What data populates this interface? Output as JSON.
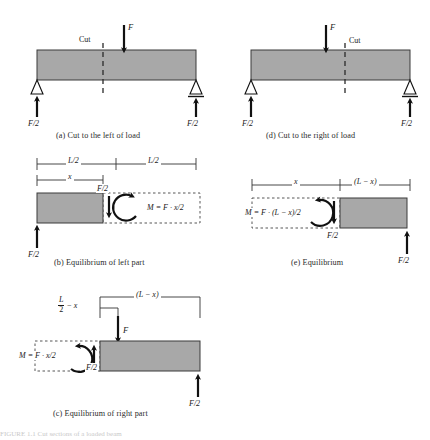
{
  "figure": {
    "colors": {
      "beam_fill": "#a8a8a8",
      "beam_stroke": "#3a3a3a",
      "line": "#1a1a1a",
      "dashed": "#2a2a2a",
      "caption": "#2b2b2b",
      "background": "#ffffff"
    },
    "panels": [
      {
        "id": "a",
        "caption": "(a) Cut to the left of load",
        "labels": {
          "cut": "Cut",
          "load": "F",
          "reaction_left": "F/2",
          "reaction_right": "F/2"
        }
      },
      {
        "id": "d",
        "caption": "(d) Cut to the right of load",
        "labels": {
          "cut": "Cut",
          "load": "F",
          "reaction_left": "F/2",
          "reaction_right": "F/2"
        }
      },
      {
        "id": "b",
        "caption": "(b) Equilibrium of left part",
        "labels": {
          "dim_half_left": "L/2",
          "dim_half_right": "L/2",
          "dim_x": "x",
          "shear": "F/2",
          "moment": "M = F · x/2",
          "reaction_left": "F/2"
        }
      },
      {
        "id": "e",
        "caption": "(e) Equilibrium",
        "labels": {
          "dim_x": "x",
          "dim_Lx": "(L − x)",
          "moment": "M = F · (L − x)/2",
          "shear": "F/2",
          "reaction_right": "F/2"
        }
      },
      {
        "id": "c",
        "caption": "(c) Equilibrium of right part",
        "labels": {
          "dim_half_minus_x_num": "L",
          "dim_half_minus_x_den": "2",
          "dim_half_minus_x_rest": "− x",
          "dim_Lx": "(L − x)",
          "load": "F",
          "moment": "M = F · x/2",
          "shear": "F/2",
          "reaction_right": "F/2"
        }
      }
    ],
    "footer_fragment": "FIGURE 1.1 Cut sections of a loaded beam"
  }
}
